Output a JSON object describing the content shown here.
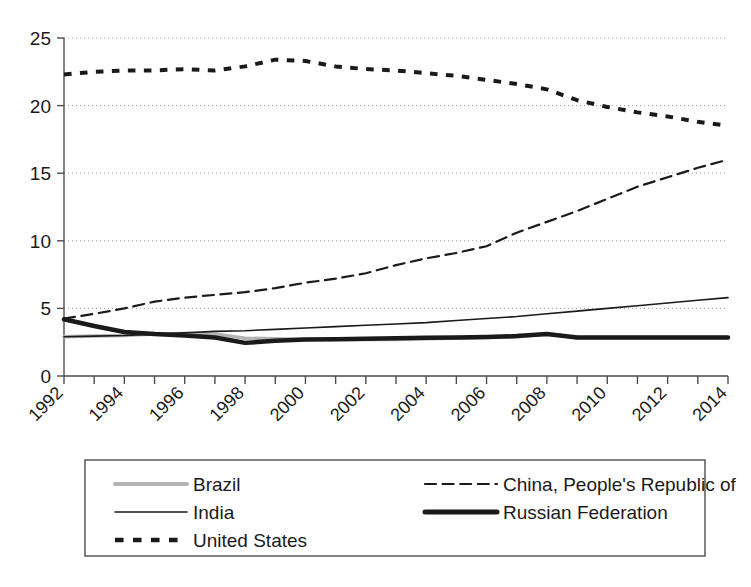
{
  "chart_data": {
    "type": "line",
    "title": "",
    "subtitle": "",
    "xlabel": "",
    "ylabel": "",
    "xlim": [
      1992,
      2014
    ],
    "ylim": [
      0,
      25
    ],
    "yticks": [
      0,
      5,
      10,
      15,
      20,
      25
    ],
    "ytick_labels": [
      "0",
      "5",
      "10",
      "15",
      "20",
      "25"
    ],
    "xticks": [
      1992,
      1993,
      1994,
      1995,
      1996,
      1997,
      1998,
      1999,
      2000,
      2001,
      2002,
      2003,
      2004,
      2005,
      2006,
      2007,
      2008,
      2009,
      2010,
      2011,
      2012,
      2013,
      2014
    ],
    "xtick_labels_shown": [
      "1992",
      "1994",
      "1996",
      "1998",
      "2000",
      "2002",
      "2004",
      "2006",
      "2008",
      "2010",
      "2012",
      "2014"
    ],
    "xtick_label_rotation": 45,
    "grid": true,
    "grid_style": "dotted-horizontal",
    "legend_position": "bottom",
    "x": [
      1992,
      1993,
      1994,
      1995,
      1996,
      1997,
      1998,
      1999,
      2000,
      2001,
      2002,
      2003,
      2004,
      2005,
      2006,
      2007,
      2008,
      2009,
      2010,
      2011,
      2012,
      2013,
      2014
    ],
    "series": [
      {
        "name": "Brazil",
        "color": "#b3b3b3",
        "style": "solid",
        "width": 3.5,
        "values": [
          2.9,
          2.95,
          3.0,
          3.1,
          3.15,
          3.1,
          2.8,
          2.75,
          2.7,
          2.7,
          2.7,
          2.7,
          2.75,
          2.8,
          2.85,
          2.9,
          3.1,
          2.85,
          2.85,
          2.85,
          2.85,
          2.85,
          2.85
        ]
      },
      {
        "name": "China, People's Republic of",
        "color": "#1a1a1a",
        "style": "dashed",
        "width": 2.2,
        "values": [
          4.25,
          4.6,
          5.0,
          5.5,
          5.8,
          6.0,
          6.2,
          6.5,
          6.9,
          7.2,
          7.6,
          8.2,
          8.7,
          9.1,
          9.6,
          10.6,
          11.4,
          12.2,
          13.1,
          14.0,
          14.7,
          15.4,
          16.0
        ]
      },
      {
        "name": "India",
        "color": "#1a1a1a",
        "style": "solid",
        "width": 1.6,
        "values": [
          2.9,
          2.95,
          3.0,
          3.1,
          3.2,
          3.3,
          3.35,
          3.45,
          3.55,
          3.65,
          3.75,
          3.85,
          3.95,
          4.1,
          4.25,
          4.4,
          4.6,
          4.8,
          5.0,
          5.2,
          5.4,
          5.6,
          5.8
        ]
      },
      {
        "name": "Russian Federation",
        "color": "#1a1a1a",
        "style": "solid",
        "width": 4.5,
        "values": [
          4.2,
          3.7,
          3.25,
          3.1,
          3.0,
          2.85,
          2.45,
          2.6,
          2.7,
          2.72,
          2.75,
          2.8,
          2.82,
          2.85,
          2.88,
          2.95,
          3.1,
          2.85,
          2.85,
          2.85,
          2.85,
          2.85,
          2.85
        ]
      },
      {
        "name": "United States",
        "color": "#1a1a1a",
        "style": "dotted",
        "width": 4.0,
        "values": [
          22.3,
          22.5,
          22.6,
          22.6,
          22.7,
          22.6,
          22.9,
          23.4,
          23.3,
          22.9,
          22.7,
          22.6,
          22.4,
          22.2,
          21.9,
          21.6,
          21.2,
          20.4,
          19.9,
          19.5,
          19.2,
          18.8,
          18.5
        ]
      }
    ],
    "legend": [
      {
        "label": "Brazil",
        "style": "solid",
        "color": "#b3b3b3",
        "width": 4
      },
      {
        "label": "China, People's Republic of",
        "style": "dashed",
        "color": "#1a1a1a",
        "width": 2.2
      },
      {
        "label": "India",
        "style": "solid",
        "color": "#1a1a1a",
        "width": 1.6
      },
      {
        "label": "Russian Federation",
        "style": "solid",
        "color": "#1a1a1a",
        "width": 5
      },
      {
        "label": "United States",
        "style": "dotted",
        "color": "#1a1a1a",
        "width": 4.5
      }
    ]
  }
}
